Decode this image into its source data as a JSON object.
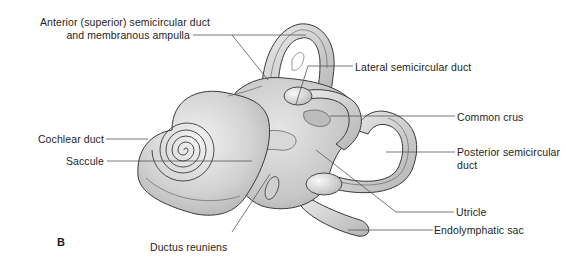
{
  "figure": {
    "panel_letter": "B",
    "labels": {
      "anterior_line1": "Anterior (superior) semicircular duct",
      "anterior_line2": "and membranous ampulla",
      "lateral": "Lateral semicircular duct",
      "common_crus": "Common crus",
      "cochlear_duct": "Cochlear duct",
      "saccule": "Saccule",
      "posterior_line1": "Posterior semicircular",
      "posterior_line2": "duct",
      "utricle": "Utricle",
      "endolymphatic_sac": "Endolymphatic sac",
      "ductus_reuniens": "Ductus reuniens"
    },
    "colors": {
      "tissue_light": "#e4e4e4",
      "tissue_mid": "#c9c9c9",
      "tissue_dark": "#a8a8a8",
      "outline": "#3a3a3a",
      "leader_line": "#555555",
      "text": "#1e1e1e"
    }
  }
}
